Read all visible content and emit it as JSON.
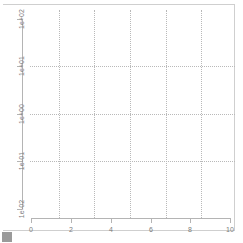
{
  "window": {
    "background_color": "#ffffff",
    "frame_color": "#cfcfcf"
  },
  "corner_handle": {
    "name": "resize-handle",
    "color": "#9a9a9a"
  },
  "chart_data": {
    "type": "scatter",
    "title": "",
    "subtitle": "",
    "xlabel": "",
    "ylabel": "",
    "series": [
      {
        "name": "",
        "x": [],
        "y": []
      }
    ],
    "x": [],
    "values": [],
    "xlim": [
      0,
      10.4
    ],
    "ylim": [
      0.01,
      100
    ],
    "xscale": "linear",
    "yscale": "log",
    "grid": true,
    "grid_style": "dotted",
    "grid_color": "#b9b9b9",
    "legend": null,
    "legend_position": "none",
    "annotations": [],
    "empty_panel": true,
    "axis_color": "#b4b4b4",
    "tick_label_color": "#7d7d7d",
    "xaxis": {
      "tick_labels": [
        "0",
        "2",
        "4",
        "6",
        "8",
        "10"
      ],
      "tick_values": [
        0,
        2,
        4,
        6,
        8,
        10
      ],
      "tick_pixel_x": [
        31,
        71,
        111,
        151,
        190,
        230
      ]
    },
    "yaxis": {
      "tick_labels": [
        "1e+02",
        "1e+01",
        "1e+00",
        "1e-01",
        "1e-02"
      ],
      "tick_values": [
        100,
        10,
        1,
        0.1,
        0.01
      ],
      "tick_pixel_y": [
        19,
        66,
        114,
        161,
        209
      ],
      "label_rotation": -90
    },
    "gridlines": {
      "horizontal_pixel_y": [
        66,
        114,
        161
      ],
      "horizontal_values": [
        10,
        1,
        0.1
      ],
      "vertical_pixel_x": [
        59,
        94,
        130,
        166,
        201
      ],
      "vertical_values": [
        1.45,
        3.2,
        5.0,
        6.8,
        8.55
      ]
    }
  }
}
